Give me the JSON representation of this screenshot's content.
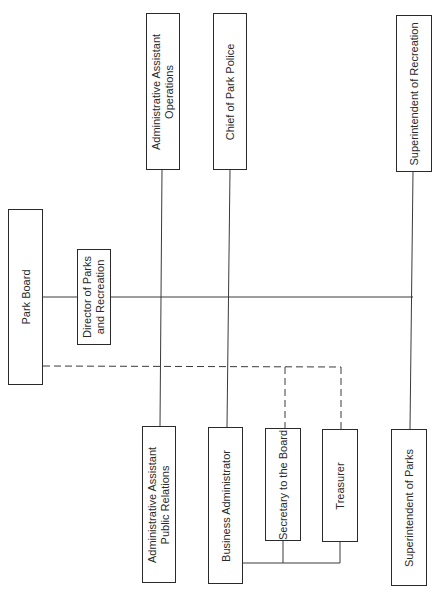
{
  "diagram": {
    "type": "org-chart",
    "orientation": "rotated-90-ccw",
    "colors": {
      "line": "#3a3a3a",
      "border": "#2a2a2a",
      "text": "#2a2a2a",
      "background": "#ffffff"
    },
    "nodes": [
      {
        "id": "park-board",
        "lines": [
          "Park Board"
        ],
        "box": [
          8,
          209,
          35,
          176
        ]
      },
      {
        "id": "director",
        "lines": [
          "Director of Parks",
          "and Recreation"
        ],
        "box": [
          77,
          249,
          34,
          96
        ]
      },
      {
        "id": "admin-ops",
        "lines": [
          "Administrative Assistant",
          "Operations"
        ],
        "box": [
          146,
          13,
          34,
          157
        ]
      },
      {
        "id": "chief-police",
        "lines": [
          "Chief of Park Police"
        ],
        "box": [
          213,
          13,
          34,
          157
        ]
      },
      {
        "id": "supt-recreation",
        "lines": [
          "Superintendent of Recreation"
        ],
        "box": [
          396,
          15,
          36,
          157
        ]
      },
      {
        "id": "admin-pr",
        "lines": [
          "Administrative Assistant",
          "Public Relations"
        ],
        "box": [
          142,
          426,
          34,
          157
        ]
      },
      {
        "id": "business-admin",
        "lines": [
          "Business Administrator"
        ],
        "box": [
          208,
          427,
          35,
          157
        ]
      },
      {
        "id": "secretary",
        "lines": [
          "Secretary to the Board"
        ],
        "box": [
          265,
          428,
          36,
          113
        ]
      },
      {
        "id": "treasurer",
        "lines": [
          "Treasurer"
        ],
        "box": [
          322,
          429,
          36,
          113
        ]
      },
      {
        "id": "supt-parks",
        "lines": [
          "Superintendent of Parks"
        ],
        "box": [
          391,
          429,
          36,
          157
        ]
      }
    ],
    "solid_lines": [
      [
        43,
        297,
        77,
        297
      ],
      [
        111,
        297,
        413,
        297
      ],
      [
        162,
        170,
        160,
        426
      ],
      [
        230,
        170,
        227,
        427
      ],
      [
        413,
        172,
        410,
        429
      ],
      [
        243,
        563,
        340,
        563
      ],
      [
        283,
        541,
        283,
        563
      ],
      [
        340,
        542,
        340,
        563
      ]
    ],
    "dashed_lines": [
      [
        43,
        366,
        341,
        367
      ],
      [
        285,
        367,
        285,
        428
      ],
      [
        341,
        367,
        341,
        429
      ]
    ]
  }
}
